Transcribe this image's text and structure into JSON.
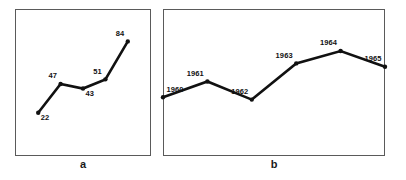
{
  "figure": {
    "background_color": "#ffffff",
    "line_color": "#111111",
    "frame_color": "#5a5a5a",
    "label_color": "#111111"
  },
  "panels": [
    {
      "id": "a",
      "caption": "a",
      "labels": [
        "22",
        "47",
        "43",
        "51",
        "84"
      ]
    },
    {
      "id": "b",
      "caption": "b",
      "labels": [
        "1960",
        "1961",
        "1962",
        "1963",
        "1964",
        "1965"
      ]
    }
  ],
  "chart_data": [
    {
      "type": "line",
      "title": "",
      "subtitle": "",
      "xlabel": "",
      "ylabel": "",
      "caption": "a",
      "grid": false,
      "legend": false,
      "axis_ticks": false,
      "categories": [
        "1",
        "2",
        "3",
        "4",
        "5"
      ],
      "x": [
        1,
        2,
        3,
        4,
        5
      ],
      "values": [
        22,
        47,
        43,
        51,
        84
      ],
      "point_labels": [
        "22",
        "47",
        "43",
        "51",
        "84"
      ],
      "label_positions": [
        "below-right",
        "above-left",
        "below-right",
        "above-left",
        "above-left"
      ],
      "ylim": [
        0,
        100
      ],
      "xlim": [
        0.5,
        5.5
      ],
      "markers": true,
      "line_width": 2.6
    },
    {
      "type": "line",
      "title": "",
      "subtitle": "",
      "xlabel": "",
      "ylabel": "",
      "caption": "b",
      "grid": false,
      "legend": false,
      "axis_ticks": false,
      "categories": [
        "1960",
        "1961",
        "1962",
        "1963",
        "1964",
        "1965"
      ],
      "x": [
        1960,
        1961,
        1962,
        1963,
        1964,
        1965
      ],
      "values": [
        36,
        50,
        34,
        66,
        77,
        63
      ],
      "point_labels": [
        "1960",
        "1961",
        "1962",
        "1963",
        "1964",
        "1965"
      ],
      "label_positions": [
        "above-right",
        "above-left",
        "above-left",
        "above-left",
        "above-left",
        "above-left"
      ],
      "ylim": [
        0,
        100
      ],
      "xlim": [
        1960,
        1965
      ],
      "markers": true,
      "line_width": 2.6
    }
  ]
}
